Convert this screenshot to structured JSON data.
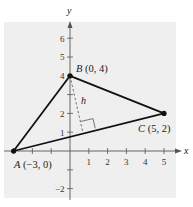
{
  "diagram": {
    "axes": {
      "x_label": "x",
      "y_label": "y",
      "x_ticks": [
        {
          "value": -3,
          "label": ""
        },
        {
          "value": -2,
          "label": ""
        },
        {
          "value": -1,
          "label": ""
        },
        {
          "value": 1,
          "label": "1"
        },
        {
          "value": 2,
          "label": "2"
        },
        {
          "value": 3,
          "label": "3"
        },
        {
          "value": 4,
          "label": "4"
        },
        {
          "value": 5,
          "label": "5"
        }
      ],
      "y_ticks": [
        {
          "value": -2,
          "label": "−2"
        },
        {
          "value": -1,
          "label": ""
        },
        {
          "value": 1,
          "label": "1"
        },
        {
          "value": 2,
          "label": "2"
        },
        {
          "value": 3,
          "label": ""
        },
        {
          "value": 4,
          "label": "4"
        },
        {
          "value": 5,
          "label": "5"
        },
        {
          "value": 6,
          "label": "6"
        }
      ]
    },
    "points": {
      "A": {
        "name": "A",
        "coords": "(−3, 0)",
        "x": -3,
        "y": 0
      },
      "B": {
        "name": "B",
        "coords": "(0, 4)",
        "x": 0,
        "y": 4
      },
      "C": {
        "name": "C",
        "coords": "(5, 2)",
        "x": 5,
        "y": 2
      }
    },
    "altitude_label": "h",
    "colors": {
      "grid_background": "#efefef",
      "lines": "#111111",
      "axes": "#555555"
    }
  }
}
